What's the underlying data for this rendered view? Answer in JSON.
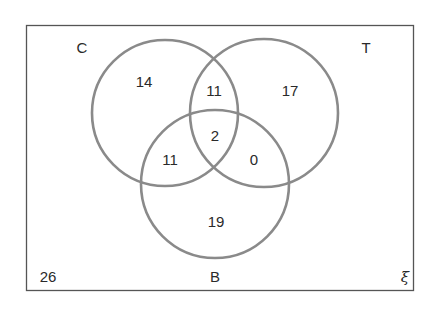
{
  "diagram": {
    "type": "venn",
    "universal_set_symbol": "ξ",
    "sets": [
      {
        "name": "C",
        "label": "C"
      },
      {
        "name": "T",
        "label": "T"
      },
      {
        "name": "B",
        "label": "B"
      }
    ],
    "regions": {
      "C_only": "14",
      "T_only": "17",
      "B_only": "19",
      "C_and_T_only": "11",
      "C_and_B_only": "11",
      "T_and_B_only": "0",
      "C_and_T_and_B": "2",
      "outside": "26"
    },
    "colors": {
      "circle_stroke": "#8a8a8a",
      "frame_stroke": "#555555",
      "text": "#2a2a2a"
    }
  }
}
